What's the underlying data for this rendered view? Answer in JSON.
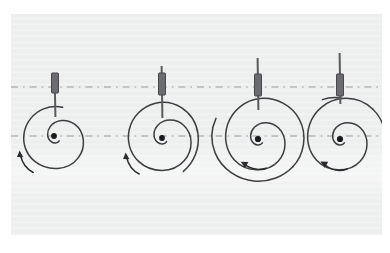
{
  "figure": {
    "kind": "physics-diagram",
    "panel": {
      "background_color": "#edeeee",
      "page_background_color": "#ffffff",
      "x": 11,
      "y": 14,
      "width": 371,
      "height": 221
    },
    "stroke_colors": {
      "spiral": "#3d3d42",
      "axis_dash": "#9a9a9f",
      "rod": "#5a5a60",
      "bob_fill": "#6b6b70",
      "bob_stroke": "#47474c",
      "arrow": "#2b2b30",
      "center_dot": "#1a1a1e"
    },
    "axes": [
      {
        "name": "upper-reference-axis",
        "y": 87,
        "x_start": 11,
        "x_end": 390,
        "style": "dash-dot"
      },
      {
        "name": "lower-reference-axis",
        "y": 136,
        "x_start": 11,
        "x_end": 390,
        "style": "dash-dot"
      }
    ],
    "stages": [
      {
        "index": 1,
        "label": "stage-1",
        "center_x": 54,
        "center_y": 136,
        "spiral_start_angle_deg": 250,
        "spiral_turns": 1.05,
        "spiral_outer_radius": 40,
        "rod_top_y": 73,
        "bob_top_y": 73,
        "bob_bottom_y": 93,
        "bob_width": 7,
        "bob_x": 55,
        "rod_bottom_y": 117,
        "arrow": {
          "name": "rotation-arrow-1",
          "direction": "counterclockwise",
          "head_x": 19,
          "head_y": 153
        }
      },
      {
        "index": 2,
        "label": "stage-2",
        "center_x": 162,
        "center_y": 138,
        "spiral_start_angle_deg": 250,
        "spiral_turns": 1.2,
        "spiral_outer_radius": 41,
        "rod_top_y": 66,
        "bob_top_y": 73,
        "bob_bottom_y": 95,
        "bob_width": 7,
        "bob_x": 162,
        "rod_bottom_y": 118,
        "arrow": {
          "name": "rotation-arrow-2",
          "direction": "counterclockwise",
          "head_x": 125,
          "head_y": 155
        }
      },
      {
        "index": 3,
        "label": "stage-3",
        "center_x": 258,
        "center_y": 139,
        "spiral_start_angle_deg": 250,
        "spiral_turns": 1.42,
        "spiral_outer_radius": 43,
        "rod_top_y": 58,
        "bob_top_y": 74,
        "bob_bottom_y": 96,
        "bob_width": 7,
        "bob_x": 258,
        "rod_bottom_y": 110,
        "arrow": {
          "name": "rotation-arrow-3",
          "direction": "counterclockwise",
          "head_x": 243,
          "head_y": 161
        }
      },
      {
        "index": 4,
        "label": "stage-4",
        "center_x": 340,
        "center_y": 139,
        "spiral_start_angle_deg": 250,
        "spiral_turns": 1.6,
        "spiral_outer_radius": 43,
        "rod_top_y": 53,
        "bob_top_y": 74,
        "bob_bottom_y": 96,
        "bob_width": 7,
        "bob_x": 340,
        "rod_bottom_y": 104,
        "arrow": {
          "name": "rotation-arrow-4",
          "direction": "counterclockwise",
          "head_x": 322,
          "head_y": 161
        }
      }
    ]
  }
}
